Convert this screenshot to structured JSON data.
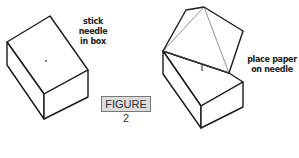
{
  "figure": {
    "label": "FIGURE 2",
    "label_bg": "#dcdcdc"
  },
  "left_panel": {
    "caption_line1": "stick needle",
    "caption_line2": "in box"
  },
  "right_panel": {
    "caption_line1": "place paper",
    "caption_line2": "on needle"
  },
  "colors": {
    "stroke": "#1a1a1a",
    "background": "#ffffff"
  }
}
